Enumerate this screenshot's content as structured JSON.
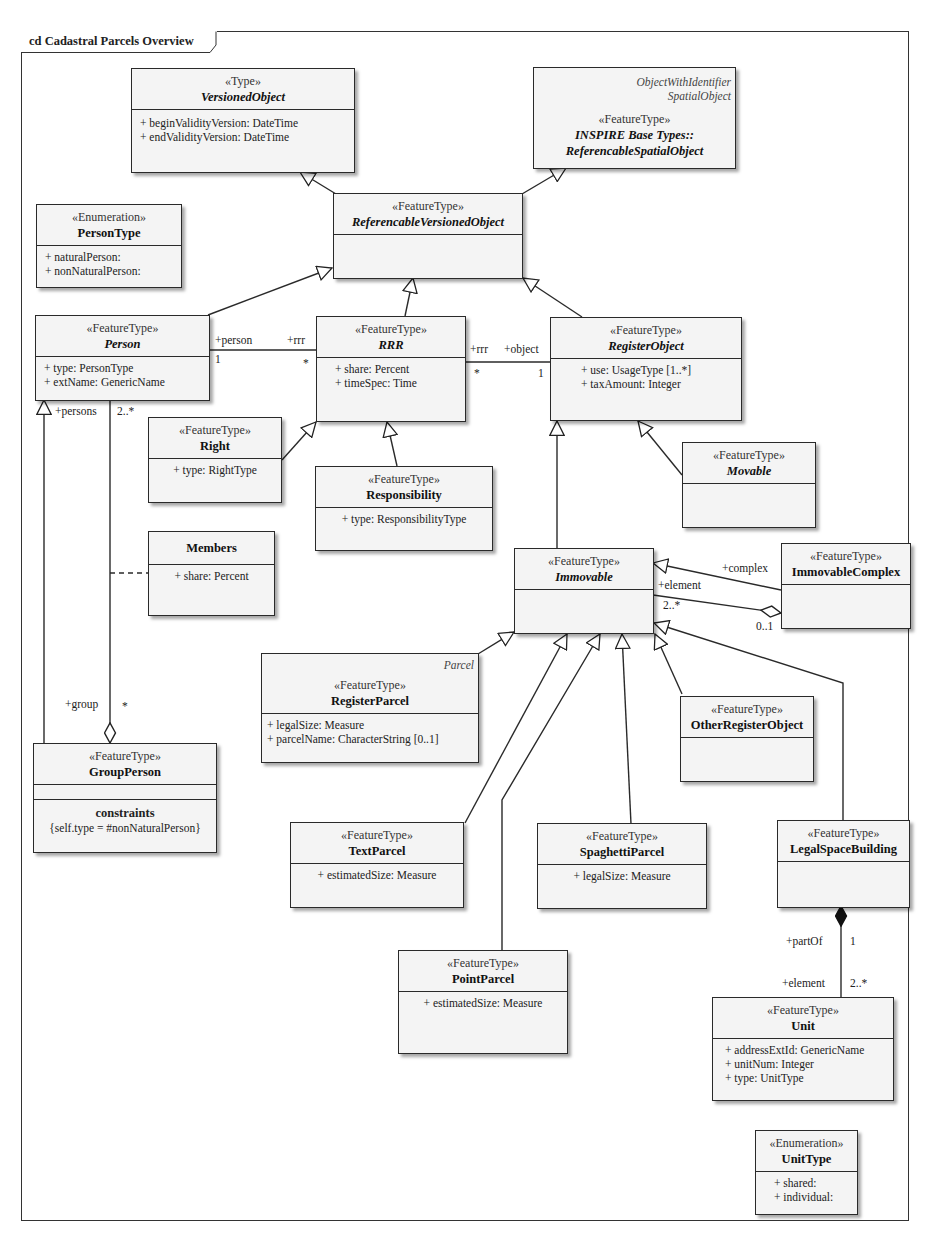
{
  "diagram": {
    "title": "cd Cadastral Parcels Overview"
  },
  "classes": {
    "versionedObject": {
      "stereotype": "«Type»",
      "name": "VersionedObject",
      "attributes": [
        "+ beginValidityVersion:  DateTime",
        "+ endValidityVersion:  DateTime"
      ]
    },
    "referencableSpatialObject": {
      "tags": [
        "ObjectWithIdentifier",
        "SpatialObject"
      ],
      "stereotype": "«FeatureType»",
      "name_line1": "INSPIRE Base Types::",
      "name_line2": "ReferencableSpatialObject"
    },
    "referencableVersionedObject": {
      "stereotype": "«FeatureType»",
      "name": "ReferencableVersionedObject"
    },
    "personType": {
      "stereotype": "«Enumeration»",
      "name": "PersonType",
      "attributes": [
        "+ naturalPerson:",
        "+ nonNaturalPerson:"
      ]
    },
    "person": {
      "stereotype": "«FeatureType»",
      "name": "Person",
      "attributes": [
        "+ type:  PersonType",
        "+ extName:  GenericName"
      ]
    },
    "rrr": {
      "stereotype": "«FeatureType»",
      "name": "RRR",
      "attributes": [
        "+ share:  Percent",
        "+ timeSpec:  Time"
      ]
    },
    "registerObject": {
      "stereotype": "«FeatureType»",
      "name": "RegisterObject",
      "attributes": [
        "+ use:  UsageType [1..*]",
        "+ taxAmount:  Integer"
      ]
    },
    "right": {
      "stereotype": "«FeatureType»",
      "name": "Right",
      "attributes": [
        "+ type:  RightType"
      ]
    },
    "responsibility": {
      "stereotype": "«FeatureType»",
      "name": "Responsibility",
      "attributes": [
        "+ type:  ResponsibilityType"
      ]
    },
    "movable": {
      "stereotype": "«FeatureType»",
      "name": "Movable"
    },
    "members": {
      "name": "Members",
      "attributes": [
        "+ share:  Percent"
      ]
    },
    "immovable": {
      "stereotype": "«FeatureType»",
      "name": "Immovable"
    },
    "immovableComplex": {
      "stereotype": "«FeatureType»",
      "name": "ImmovableComplex"
    },
    "registerParcel": {
      "tag": "Parcel",
      "stereotype": "«FeatureType»",
      "name": "RegisterParcel",
      "attributes": [
        "+ legalSize:  Measure",
        "+ parcelName:  CharacterString [0..1]"
      ]
    },
    "otherRegisterObject": {
      "stereotype": "«FeatureType»",
      "name": "OtherRegisterObject"
    },
    "groupPerson": {
      "stereotype": "«FeatureType»",
      "name": "GroupPerson",
      "constraints_title": "constraints",
      "constraint": "{self.type = #nonNaturalPerson}"
    },
    "textParcel": {
      "stereotype": "«FeatureType»",
      "name": "TextParcel",
      "attributes": [
        "+ estimatedSize:  Measure"
      ]
    },
    "spaghettiParcel": {
      "stereotype": "«FeatureType»",
      "name": "SpaghettiParcel",
      "attributes": [
        "+ legalSize:  Measure"
      ]
    },
    "legalSpaceBuilding": {
      "stereotype": "«FeatureType»",
      "name": "LegalSpaceBuilding"
    },
    "pointParcel": {
      "stereotype": "«FeatureType»",
      "name": "PointParcel",
      "attributes": [
        "+ estimatedSize:  Measure"
      ]
    },
    "unit": {
      "stereotype": "«FeatureType»",
      "name": "Unit",
      "attributes": [
        "+ addressExtId:  GenericName",
        "+ unitNum:  Integer",
        "+ type:  UnitType"
      ]
    },
    "unitType": {
      "stereotype": "«Enumeration»",
      "name": "UnitType",
      "attributes": [
        "+ shared:",
        "+ individual:"
      ]
    }
  },
  "associations": {
    "person_rrr": {
      "role_person": "+person",
      "mult_person": "1",
      "role_rrr": "+rrr",
      "mult_rrr": "*"
    },
    "rrr_object": {
      "role_rrr": "+rrr",
      "mult_rrr": "*",
      "role_object": "+object",
      "mult_object": "1"
    },
    "group_persons": {
      "role_persons": "+persons",
      "mult_persons": "2..*",
      "role_group": "+group",
      "mult_group": "*"
    },
    "complex_element": {
      "role_complex": "+complex",
      "role_element": "+element",
      "mult_element": "2..*",
      "mult_complex": "0..1"
    },
    "building_unit": {
      "role_partOf": "+partOf",
      "mult_partOf": "1",
      "role_element": "+element",
      "mult_element": "2..*"
    }
  }
}
